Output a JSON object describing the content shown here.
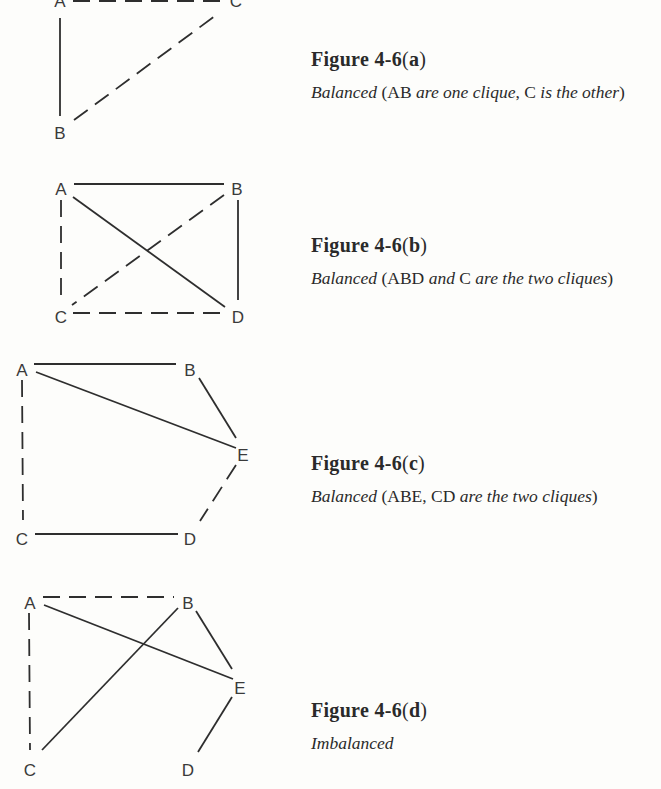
{
  "figures": [
    {
      "id": "a",
      "title_main": "Figure 4-6",
      "title_open": "(",
      "title_letter": "a",
      "title_close": ")",
      "desc_parts": [
        {
          "text": "Balanced",
          "italic": true
        },
        {
          "text": " (AB ",
          "italic": false
        },
        {
          "text": "are one clique",
          "italic": true
        },
        {
          "text": ", C ",
          "italic": false
        },
        {
          "text": "is the other",
          "italic": true
        },
        {
          "text": ")",
          "italic": false
        }
      ],
      "nodes": [
        {
          "label": "A",
          "x": 60,
          "y": 3
        },
        {
          "label": "C",
          "x": 236,
          "y": 3
        },
        {
          "label": "B",
          "x": 60,
          "y": 135
        }
      ],
      "edges": [
        {
          "from": "A",
          "to": "B",
          "style": "solid",
          "x1": 60,
          "y1": 18,
          "x2": 60,
          "y2": 116
        },
        {
          "from": "A",
          "to": "C",
          "style": "dashed",
          "x1": 73,
          "y1": 1,
          "x2": 222,
          "y2": 1
        },
        {
          "from": "B",
          "to": "C",
          "style": "dashed",
          "x1": 74,
          "y1": 120,
          "x2": 219,
          "y2": 13
        }
      ]
    },
    {
      "id": "b",
      "title_main": "Figure 4-6",
      "title_open": "(",
      "title_letter": "b",
      "title_close": ")",
      "desc_parts": [
        {
          "text": "Balanced",
          "italic": true
        },
        {
          "text": " (ABD ",
          "italic": false
        },
        {
          "text": "and",
          "italic": true
        },
        {
          "text": " C ",
          "italic": false
        },
        {
          "text": "are the two cliques",
          "italic": true
        },
        {
          "text": ")",
          "italic": false
        }
      ],
      "nodes": [
        {
          "label": "A",
          "x": 61,
          "y": 191
        },
        {
          "label": "B",
          "x": 237,
          "y": 191
        },
        {
          "label": "C",
          "x": 61,
          "y": 319
        },
        {
          "label": "D",
          "x": 238,
          "y": 319
        }
      ],
      "edges": [
        {
          "from": "A",
          "to": "B",
          "style": "solid",
          "x1": 74,
          "y1": 184,
          "x2": 224,
          "y2": 184
        },
        {
          "from": "A",
          "to": "C",
          "style": "dashed",
          "x1": 61,
          "y1": 200,
          "x2": 61,
          "y2": 300
        },
        {
          "from": "A",
          "to": "D",
          "style": "solid",
          "x1": 73,
          "y1": 197,
          "x2": 225,
          "y2": 307
        },
        {
          "from": "B",
          "to": "C",
          "style": "dashed",
          "x1": 224,
          "y1": 195,
          "x2": 72,
          "y2": 305
        },
        {
          "from": "B",
          "to": "D",
          "style": "solid",
          "x1": 238,
          "y1": 200,
          "x2": 238,
          "y2": 300
        },
        {
          "from": "C",
          "to": "D",
          "style": "dashed",
          "x1": 73,
          "y1": 313,
          "x2": 225,
          "y2": 313
        }
      ]
    },
    {
      "id": "c",
      "title_main": "Figure 4-6",
      "title_open": "(",
      "title_letter": "c",
      "title_close": ")",
      "desc_parts": [
        {
          "text": "Balanced",
          "italic": true
        },
        {
          "text": " (ABE, CD ",
          "italic": false
        },
        {
          "text": "are the two cliques",
          "italic": true
        },
        {
          "text": ")",
          "italic": false
        }
      ],
      "nodes": [
        {
          "label": "A",
          "x": 22,
          "y": 372
        },
        {
          "label": "B",
          "x": 190,
          "y": 372
        },
        {
          "label": "E",
          "x": 243,
          "y": 457
        },
        {
          "label": "C",
          "x": 22,
          "y": 541
        },
        {
          "label": "D",
          "x": 190,
          "y": 541
        }
      ],
      "edges": [
        {
          "from": "A",
          "to": "B",
          "style": "solid",
          "x1": 34,
          "y1": 364,
          "x2": 176,
          "y2": 364
        },
        {
          "from": "A",
          "to": "E",
          "style": "solid",
          "x1": 36,
          "y1": 372,
          "x2": 236,
          "y2": 448
        },
        {
          "from": "B",
          "to": "E",
          "style": "solid",
          "x1": 199,
          "y1": 378,
          "x2": 236,
          "y2": 438
        },
        {
          "from": "A",
          "to": "C",
          "style": "dashed",
          "x1": 22,
          "y1": 380,
          "x2": 23,
          "y2": 520
        },
        {
          "from": "C",
          "to": "D",
          "style": "solid",
          "x1": 35,
          "y1": 534,
          "x2": 178,
          "y2": 534
        },
        {
          "from": "E",
          "to": "D",
          "style": "dashed",
          "x1": 236,
          "y1": 465,
          "x2": 200,
          "y2": 521
        }
      ]
    },
    {
      "id": "d",
      "title_main": "Figure 4-6",
      "title_open": "(",
      "title_letter": "d",
      "title_close": ")",
      "desc_parts": [
        {
          "text": "Imbalanced",
          "italic": true
        }
      ],
      "nodes": [
        {
          "label": "A",
          "x": 30,
          "y": 605
        },
        {
          "label": "B",
          "x": 188,
          "y": 605
        },
        {
          "label": "E",
          "x": 240,
          "y": 690
        },
        {
          "label": "C",
          "x": 30,
          "y": 772
        },
        {
          "label": "D",
          "x": 188,
          "y": 772
        }
      ],
      "edges": [
        {
          "from": "A",
          "to": "B",
          "style": "dashed",
          "x1": 43,
          "y1": 597,
          "x2": 174,
          "y2": 597
        },
        {
          "from": "A",
          "to": "E",
          "style": "solid",
          "x1": 44,
          "y1": 605,
          "x2": 233,
          "y2": 679
        },
        {
          "from": "B",
          "to": "C",
          "style": "solid",
          "x1": 178,
          "y1": 608,
          "x2": 42,
          "y2": 750
        },
        {
          "from": "B",
          "to": "E",
          "style": "solid",
          "x1": 196,
          "y1": 611,
          "x2": 232,
          "y2": 669
        },
        {
          "from": "A",
          "to": "C",
          "style": "dashed",
          "x1": 29,
          "y1": 613,
          "x2": 30,
          "y2": 750
        },
        {
          "from": "E",
          "to": "D",
          "style": "solid",
          "x1": 232,
          "y1": 697,
          "x2": 198,
          "y2": 752
        }
      ]
    }
  ],
  "caption_positions": [
    {
      "top": 48
    },
    {
      "top": 234
    },
    {
      "top": 452
    },
    {
      "top": 699
    }
  ],
  "colors": {
    "background": "#fdfdfb",
    "ink": "#2e2e2e",
    "text": "#2a2a2a"
  }
}
